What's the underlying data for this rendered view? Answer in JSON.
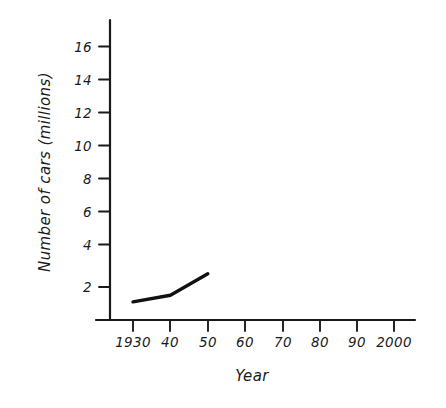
{
  "chart_data": {
    "type": "line",
    "title": "",
    "xlabel": "Year",
    "ylabel": "Number of cars (millions)",
    "x": [
      1930,
      1940,
      1950
    ],
    "values": [
      1.1,
      1.5,
      2.8
    ],
    "series": [
      {
        "name": "Number of cars",
        "x": [
          1930,
          1940,
          1950
        ],
        "values": [
          1.1,
          1.5,
          2.8
        ]
      }
    ],
    "x_tick_values": [
      1930,
      1940,
      1950,
      1960,
      1970,
      1980,
      1990,
      2000
    ],
    "x_tick_labels": [
      "1930",
      "40",
      "50",
      "60",
      "70",
      "80",
      "90",
      "2000"
    ],
    "y_tick_values": [
      2,
      4,
      6,
      8,
      10,
      12,
      14,
      16
    ],
    "y_tick_labels": [
      "2",
      "4",
      "6",
      "8",
      "10",
      "12",
      "14",
      "16"
    ],
    "xlim": [
      1925,
      2005
    ],
    "ylim": [
      0,
      17.5
    ],
    "grid": false,
    "legend": false,
    "legend_position": "none",
    "line_color": "#111111",
    "axis_color": "#1a1a1a",
    "background_color": "#ffffff"
  },
  "axes": {
    "y_title": "Number of cars (millions)",
    "x_title": "Year"
  },
  "y_ticks": [
    {
      "label": "16"
    },
    {
      "label": "14"
    },
    {
      "label": "12"
    },
    {
      "label": "10"
    },
    {
      "label": "8"
    },
    {
      "label": "6"
    },
    {
      "label": "4"
    },
    {
      "label": "2"
    }
  ],
  "x_ticks": [
    {
      "label": "1930"
    },
    {
      "label": "40"
    },
    {
      "label": "50"
    },
    {
      "label": "60"
    },
    {
      "label": "70"
    },
    {
      "label": "80"
    },
    {
      "label": "90"
    },
    {
      "label": "2000"
    }
  ]
}
